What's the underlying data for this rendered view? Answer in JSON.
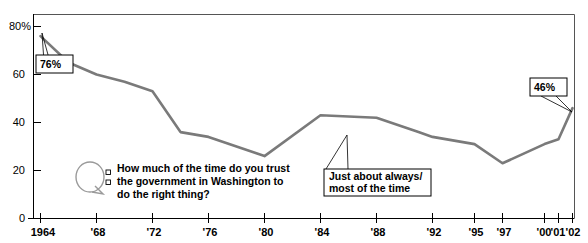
{
  "chart_data": {
    "type": "line",
    "title": "",
    "subtitle": "",
    "xlabel": "",
    "ylabel": "",
    "ylim": [
      0,
      88
    ],
    "xlim": [
      1963,
      2002.6
    ],
    "grid": false,
    "legend_position": "none",
    "series": [
      {
        "name": "Just about always/most of the time",
        "color": "#7a7a7a",
        "points": [
          {
            "year": 1964,
            "value": 76
          },
          {
            "year": 1966,
            "value": 65
          },
          {
            "year": 1968,
            "value": 60
          },
          {
            "year": 1970,
            "value": 57
          },
          {
            "year": 1972,
            "value": 53
          },
          {
            "year": 1974,
            "value": 36
          },
          {
            "year": 1976,
            "value": 34
          },
          {
            "year": 1980,
            "value": 26
          },
          {
            "year": 1984,
            "value": 43
          },
          {
            "year": 1988,
            "value": 42
          },
          {
            "year": 1991,
            "value": 36
          },
          {
            "year": 1992,
            "value": 34
          },
          {
            "year": 1995,
            "value": 31
          },
          {
            "year": 1997,
            "value": 23
          },
          {
            "year": 2000,
            "value": 31
          },
          {
            "year": 2001,
            "value": 33
          },
          {
            "year": 2002,
            "value": 46
          }
        ]
      }
    ],
    "y_ticks": [
      {
        "value": 0,
        "label": "0"
      },
      {
        "value": 20,
        "label": "20"
      },
      {
        "value": 40,
        "label": "40"
      },
      {
        "value": 60,
        "label": "60"
      },
      {
        "value": 80,
        "label": "80%"
      }
    ],
    "x_ticks": [
      {
        "value": 1964,
        "label": "1964"
      },
      {
        "value": 1968,
        "label": "'68"
      },
      {
        "value": 1972,
        "label": "'72"
      },
      {
        "value": 1976,
        "label": "'76"
      },
      {
        "value": 1980,
        "label": "'80"
      },
      {
        "value": 1984,
        "label": "'84"
      },
      {
        "value": 1988,
        "label": "'88"
      },
      {
        "value": 1992,
        "label": "'92"
      },
      {
        "value": 1995,
        "label": "'95"
      },
      {
        "value": 1997,
        "label": "'97"
      },
      {
        "value": 2000,
        "label": "'00"
      },
      {
        "value": 2001,
        "label": "'01"
      },
      {
        "value": 2002,
        "label": "'02"
      }
    ],
    "data_labels": [
      {
        "id": "start",
        "text": "76%",
        "year": 1964,
        "value": 76
      },
      {
        "id": "end",
        "text": "46%",
        "year": 2002,
        "value": 46
      }
    ],
    "annotations": [
      {
        "id": "series-callout",
        "line1": "Just about always/",
        "line2": "most of the time",
        "anchor_year": 1991,
        "anchor_value": 36
      }
    ]
  },
  "question": {
    "icon": "question-speech-bubble-icon",
    "line1": "How much of the time do you trust",
    "line2": "the government in Washington to",
    "line3": "do the right thing?"
  },
  "colors": {
    "line": "#7a7a7a",
    "axis": "#000000",
    "frame": "#555555",
    "background": "#ffffff",
    "text": "#000000"
  }
}
